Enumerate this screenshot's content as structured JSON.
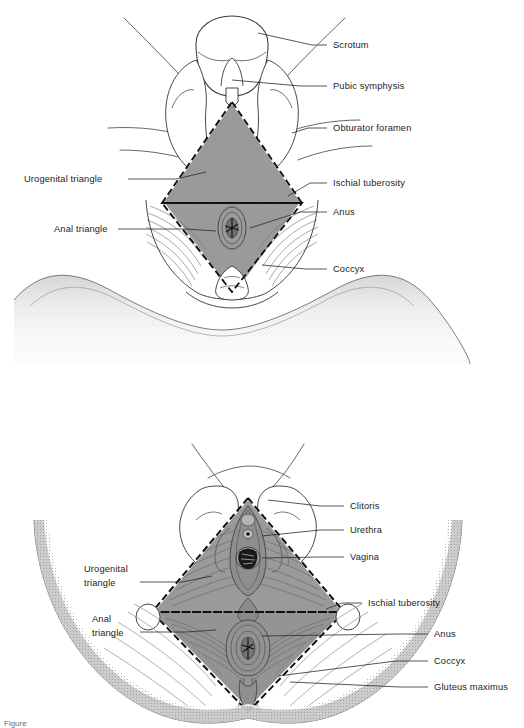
{
  "page": {
    "background_color": "#ffffff",
    "width": 524,
    "height": 728
  },
  "style": {
    "ink": "#1c1c1c",
    "line": "#4a4a4a",
    "leader": "#2b2b2b",
    "shade_gray": "#9a9a9a",
    "shade_gray_dark": "#8b8b8b",
    "stipple": "#bdbdbd",
    "muscle_line": "#6f6f6f",
    "label_color": "#1c1c1c"
  },
  "figures": [
    {
      "id": "male-perineum",
      "name": "male-perineum-figure",
      "region_title": "Male perineum (inferior view)",
      "labels": [
        {
          "id": "scrotum",
          "text": "Scrotum",
          "side": "right",
          "x": 333,
          "y": 48,
          "leader": [
            [
              327,
              45
            ],
            [
              312,
              45
            ],
            [
              258,
              33
            ]
          ]
        },
        {
          "id": "pubic-symphysis",
          "text": "Pubic symphysis",
          "side": "right",
          "x": 333,
          "y": 89,
          "leader": [
            [
              327,
              86
            ],
            [
              300,
              86
            ],
            [
              232,
              80
            ]
          ]
        },
        {
          "id": "obturator-foramen",
          "text": "Obturator foramen",
          "side": "right",
          "x": 333,
          "y": 131,
          "leader": [
            [
              327,
              128
            ],
            [
              308,
              128
            ],
            [
              292,
              133
            ]
          ]
        },
        {
          "id": "ischial-tuberosity",
          "text": "Ischial tuberosity",
          "side": "right",
          "x": 333,
          "y": 186,
          "leader": [
            [
              327,
              183
            ],
            [
              310,
              183
            ],
            [
              288,
              195
            ]
          ]
        },
        {
          "id": "anus",
          "text": "Anus",
          "side": "right",
          "x": 333,
          "y": 215,
          "leader": [
            [
              327,
              212
            ],
            [
              300,
              212
            ],
            [
              250,
              228
            ]
          ]
        },
        {
          "id": "coccyx",
          "text": "Coccyx",
          "side": "right",
          "x": 333,
          "y": 272,
          "leader": [
            [
              327,
              269
            ],
            [
              306,
              269
            ],
            [
              262,
              265
            ]
          ]
        },
        {
          "id": "urogenital-triangle",
          "text": "Urogenital triangle",
          "side": "left",
          "x": 24,
          "y": 182,
          "leader": [
            [
              128,
              179
            ],
            [
              176,
              179
            ],
            [
              204,
              172
            ]
          ]
        },
        {
          "id": "anal-triangle",
          "text": "Anal triangle",
          "side": "left",
          "x": 54,
          "y": 232,
          "leader": [
            [
              118,
              229
            ],
            [
              186,
              229
            ],
            [
              214,
              230
            ]
          ]
        }
      ]
    },
    {
      "id": "female-perineum",
      "name": "female-perineum-figure",
      "region_title": "Female perineum (inferior view)",
      "labels": [
        {
          "id": "clitoris",
          "text": "Clitoris",
          "side": "right",
          "x": 350,
          "y": 509,
          "leader": [
            [
              344,
              506
            ],
            [
              320,
              506
            ],
            [
              268,
              500
            ]
          ]
        },
        {
          "id": "urethra",
          "text": "Urethra",
          "side": "right",
          "x": 350,
          "y": 533,
          "leader": [
            [
              344,
              530
            ],
            [
              320,
              530
            ],
            [
              262,
              535
            ]
          ]
        },
        {
          "id": "vagina",
          "text": "Vagina",
          "side": "right",
          "x": 350,
          "y": 560,
          "leader": [
            [
              344,
              557
            ],
            [
              318,
              557
            ],
            [
              262,
              558
            ]
          ]
        },
        {
          "id": "ischial-tuberosity-f",
          "text": "Ischial tuberosity",
          "side": "right",
          "x": 368,
          "y": 606,
          "leader": [
            [
              362,
              603
            ],
            [
              342,
              603
            ],
            [
              325,
              608
            ]
          ]
        },
        {
          "id": "anus-f",
          "text": "Anus",
          "side": "right",
          "x": 434,
          "y": 637,
          "leader": [
            [
              428,
              634
            ],
            [
              400,
              634
            ],
            [
              262,
              636
            ]
          ]
        },
        {
          "id": "coccyx-f",
          "text": "Coccyx",
          "side": "right",
          "x": 434,
          "y": 664,
          "leader": [
            [
              428,
              661
            ],
            [
              396,
              661
            ],
            [
              278,
              675
            ]
          ]
        },
        {
          "id": "gluteus-maximus",
          "text": "Gluteus maximus",
          "side": "right",
          "x": 434,
          "y": 690,
          "leader": [
            [
              428,
              687
            ],
            [
              400,
              687
            ],
            [
              290,
              682
            ]
          ]
        },
        {
          "id": "urogenital-triangle-f",
          "text": "Urogenital\ntriangle",
          "line1": "Urogenital",
          "line2": "triangle",
          "side": "left",
          "x": 84,
          "y": 572,
          "leader": [
            [
              140,
              582
            ],
            [
              182,
              582
            ],
            [
              210,
              575
            ]
          ]
        },
        {
          "id": "anal-triangle-f",
          "text": "Anal\ntriangle",
          "line1": "Anal",
          "line2": "triangle",
          "side": "left",
          "x": 92,
          "y": 622,
          "leader": [
            [
              140,
              632
            ],
            [
              186,
              632
            ],
            [
              214,
              630
            ]
          ]
        }
      ]
    }
  ],
  "caption": {
    "visible_fragment": "Figure"
  }
}
